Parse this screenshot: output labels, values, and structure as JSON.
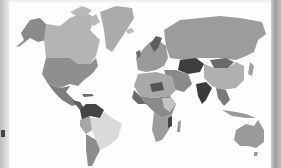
{
  "map": {
    "type": "world-choropleth",
    "style": "grayscale",
    "background": "#fdfdfd",
    "shades": {
      "lightest": "#e2e2e2",
      "light": "#c4c4c4",
      "mid_light": "#b2b2b2",
      "mid": "#9e9e9e",
      "mid_dark": "#8a8a8a",
      "dark": "#6c6c6c",
      "darkest": "#3e3e3e"
    },
    "regions": [
      {
        "name": "Alaska",
        "shade": "mid_dark"
      },
      {
        "name": "Canada",
        "shade": "mid_light"
      },
      {
        "name": "Greenland",
        "shade": "mid_light"
      },
      {
        "name": "United States",
        "shade": "mid"
      },
      {
        "name": "Mexico",
        "shade": "mid_dark"
      },
      {
        "name": "Venezuela",
        "shade": "darkest"
      },
      {
        "name": "Brazil",
        "shade": "lightest"
      },
      {
        "name": "Argentina",
        "shade": "mid"
      },
      {
        "name": "Russia",
        "shade": "mid"
      },
      {
        "name": "Kazakhstan",
        "shade": "darkest"
      },
      {
        "name": "Mongolia",
        "shade": "dark"
      },
      {
        "name": "China",
        "shade": "mid_light"
      },
      {
        "name": "India",
        "shade": "darkest"
      },
      {
        "name": "Australia",
        "shade": "mid"
      },
      {
        "name": "Africa",
        "shade": "mixed"
      },
      {
        "name": "Europe",
        "shade": "mixed"
      }
    ]
  }
}
